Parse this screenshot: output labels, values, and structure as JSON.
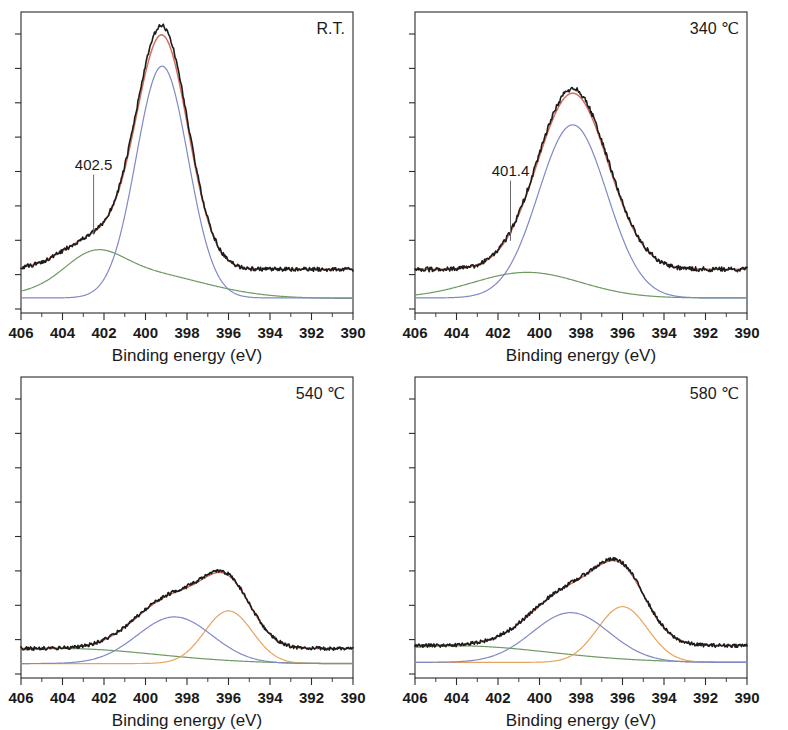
{
  "figure": {
    "type": "xps-spectra-grid",
    "rows": 2,
    "columns": 2,
    "background": "#ffffff"
  },
  "axis": {
    "xlabel": "Binding energy (eV)",
    "xticks": [
      "406",
      "404",
      "402",
      "400",
      "398",
      "396",
      "394",
      "392",
      "390"
    ],
    "xlim": [
      406,
      390
    ],
    "x_reversed": true,
    "ylabel": "",
    "yticks": [],
    "y_note": "intensity, arbitrary units (unlabeled ticks)"
  },
  "colors": {
    "data": "#1c1c1c",
    "envelope": "#d4705c",
    "component_a": "#8189c4",
    "component_b": "#e8a45c",
    "baseline": "#6f9a63",
    "frame": "#2b2b2b"
  },
  "chart_data": [
    {
      "type": "line",
      "title": "",
      "tag": "R.T.",
      "xlabel": "Binding energy (eV)",
      "ylabel": "",
      "xlim": [
        406,
        390
      ],
      "ylim": [
        0,
        1
      ],
      "grid": false,
      "legend": "none",
      "annotations": [
        {
          "text": "402.5",
          "x": 402.5,
          "target_y": 0.26,
          "label_y": 0.46
        }
      ],
      "series": [
        {
          "name": "raw data",
          "role": "data",
          "color": "#1c1c1c",
          "peaks": [
            {
              "center": 399.2,
              "height": 0.8,
              "width": 1.25,
              "shape": "gauss"
            },
            {
              "center": 402.5,
              "height": 0.1,
              "width": 1.5,
              "shape": "gauss"
            }
          ],
          "offset": 0.145,
          "noise": 0.007
        },
        {
          "name": "envelope fit",
          "role": "envelope",
          "color": "#d4705c",
          "peaks": [
            {
              "center": 399.2,
              "height": 0.77,
              "width": 1.25,
              "shape": "gauss"
            },
            {
              "center": 402.5,
              "height": 0.1,
              "width": 1.5,
              "shape": "gauss"
            }
          ],
          "offset": 0.145,
          "noise": 0
        },
        {
          "name": "component 399.2 eV",
          "role": "component_a",
          "color": "#8189c4",
          "peaks": [
            {
              "center": 399.2,
              "height": 0.77,
              "width": 1.25,
              "shape": "gauss"
            }
          ],
          "offset": 0.05,
          "noise": 0
        },
        {
          "name": "component 402.5 eV",
          "role": "baseline",
          "color": "#6f9a63",
          "peaks": [
            {
              "center": 402.5,
              "height": 0.085,
              "width": 1.35,
              "shape": "gauss"
            },
            {
              "center": 400.6,
              "height": 0.09,
              "width": 3.2,
              "shape": "gauss"
            }
          ],
          "offset": 0.048,
          "noise": 0
        }
      ]
    },
    {
      "type": "line",
      "title": "",
      "tag": "340 ℃",
      "xlabel": "Binding energy (eV)",
      "ylabel": "",
      "xlim": [
        406,
        390
      ],
      "ylim": [
        0,
        1
      ],
      "grid": false,
      "legend": "none",
      "annotations": [
        {
          "text": "401.4",
          "x": 401.4,
          "target_y": 0.24,
          "label_y": 0.44
        }
      ],
      "series": [
        {
          "name": "raw data",
          "role": "data",
          "color": "#1c1c1c",
          "peaks": [
            {
              "center": 398.4,
              "height": 0.6,
              "width": 1.7,
              "shape": "gauss"
            }
          ],
          "offset": 0.145,
          "noise": 0.008
        },
        {
          "name": "envelope fit",
          "role": "envelope",
          "color": "#d4705c",
          "peaks": [
            {
              "center": 398.4,
              "height": 0.585,
              "width": 1.7,
              "shape": "gauss"
            }
          ],
          "offset": 0.145,
          "noise": 0
        },
        {
          "name": "component 398.4 eV",
          "role": "component_a",
          "color": "#8189c4",
          "peaks": [
            {
              "center": 398.4,
              "height": 0.575,
              "width": 1.65,
              "shape": "gauss"
            }
          ],
          "offset": 0.05,
          "noise": 0
        },
        {
          "name": "component 401.4 eV",
          "role": "baseline",
          "color": "#6f9a63",
          "peaks": [
            {
              "center": 400.6,
              "height": 0.085,
              "width": 2.6,
              "shape": "gauss"
            }
          ],
          "offset": 0.05,
          "noise": 0
        }
      ]
    },
    {
      "type": "line",
      "title": "",
      "tag": "540 ℃",
      "xlabel": "Binding energy (eV)",
      "ylabel": "",
      "xlim": [
        406,
        390
      ],
      "ylim": [
        0,
        1
      ],
      "grid": false,
      "legend": "none",
      "annotations": [],
      "series": [
        {
          "name": "raw data",
          "role": "data",
          "color": "#1c1c1c",
          "peaks": [
            {
              "center": 398.6,
              "height": 0.175,
              "width": 1.8,
              "shape": "gauss"
            },
            {
              "center": 396.0,
              "height": 0.185,
              "width": 1.15,
              "shape": "gauss"
            }
          ],
          "offset": 0.098,
          "noise": 0.006
        },
        {
          "name": "envelope fit",
          "role": "envelope",
          "color": "#d4705c",
          "peaks": [
            {
              "center": 398.6,
              "height": 0.172,
              "width": 1.8,
              "shape": "gauss"
            },
            {
              "center": 396.0,
              "height": 0.182,
              "width": 1.15,
              "shape": "gauss"
            }
          ],
          "offset": 0.098,
          "noise": 0
        },
        {
          "name": "component 398.6 eV",
          "role": "component_a",
          "color": "#8189c4",
          "peaks": [
            {
              "center": 398.6,
              "height": 0.155,
              "width": 1.8,
              "shape": "gauss"
            }
          ],
          "offset": 0.048,
          "noise": 0
        },
        {
          "name": "component 396.0 eV",
          "role": "component_b",
          "color": "#e8a45c",
          "peaks": [
            {
              "center": 396.0,
              "height": 0.175,
              "width": 1.15,
              "shape": "gauss"
            }
          ],
          "offset": 0.048,
          "noise": 0
        },
        {
          "name": "baseline",
          "role": "baseline",
          "color": "#6f9a63",
          "peaks": [
            {
              "center": 404.0,
              "height": 0.05,
              "width": 4.5,
              "shape": "gauss"
            }
          ],
          "offset": 0.048,
          "noise": 0
        }
      ]
    },
    {
      "type": "line",
      "title": "",
      "tag": "580 ℃",
      "xlabel": "Binding energy (eV)",
      "ylabel": "",
      "xlim": [
        406,
        390
      ],
      "ylim": [
        0,
        1
      ],
      "grid": false,
      "legend": "none",
      "annotations": [],
      "series": [
        {
          "name": "raw data",
          "role": "data",
          "color": "#1c1c1c",
          "peaks": [
            {
              "center": 398.5,
              "height": 0.185,
              "width": 1.85,
              "shape": "gauss"
            },
            {
              "center": 396.0,
              "height": 0.2,
              "width": 1.2,
              "shape": "gauss"
            }
          ],
          "offset": 0.108,
          "noise": 0.006
        },
        {
          "name": "envelope fit",
          "role": "envelope",
          "color": "#d4705c",
          "peaks": [
            {
              "center": 398.5,
              "height": 0.182,
              "width": 1.85,
              "shape": "gauss"
            },
            {
              "center": 396.0,
              "height": 0.197,
              "width": 1.2,
              "shape": "gauss"
            }
          ],
          "offset": 0.108,
          "noise": 0
        },
        {
          "name": "component 398.5 eV",
          "role": "component_a",
          "color": "#8189c4",
          "peaks": [
            {
              "center": 398.5,
              "height": 0.165,
              "width": 1.85,
              "shape": "gauss"
            }
          ],
          "offset": 0.052,
          "noise": 0
        },
        {
          "name": "component 396.0 eV",
          "role": "component_b",
          "color": "#e8a45c",
          "peaks": [
            {
              "center": 396.0,
              "height": 0.185,
              "width": 1.2,
              "shape": "gauss"
            }
          ],
          "offset": 0.052,
          "noise": 0
        },
        {
          "name": "baseline",
          "role": "baseline",
          "color": "#6f9a63",
          "peaks": [
            {
              "center": 404.0,
              "height": 0.055,
              "width": 4.5,
              "shape": "gauss"
            }
          ],
          "offset": 0.052,
          "noise": 0
        }
      ]
    }
  ]
}
